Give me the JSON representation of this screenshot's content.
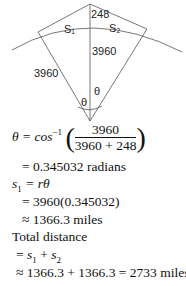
{
  "diagram": {
    "labels": {
      "height": "248",
      "s1": "S₁",
      "s2": "S₂",
      "radius_center": "3960",
      "radius_left": "3960",
      "theta_left": "θ",
      "theta_right": "θ"
    }
  },
  "math": {
    "line1": {
      "lhs": "θ = cos",
      "sup": "−1",
      "numerator": "3960",
      "denominator": "3960 + 248"
    },
    "line2": "= 0.345032 radians",
    "line3": {
      "lhs": "s",
      "sub": "1",
      "rhs": " = rθ"
    },
    "line4": "= 3960(0.345032)",
    "line5": "≈ 1366.3 miles",
    "line6": "Total distance",
    "line7": {
      "eq": "= ",
      "s": "s",
      "sub1": "1",
      "plus": " + ",
      "s2": "s",
      "sub2": "2"
    },
    "line8": "≈ 1366.3 + 1366.3 = 2733 miles"
  }
}
